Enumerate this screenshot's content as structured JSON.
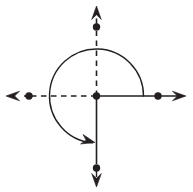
{
  "figure": {
    "title": "Coterminal rotation angle on coordinate axes",
    "canvas": {
      "width": 193,
      "height": 192,
      "background": "#ffffff"
    },
    "stroke_color": "#231f20",
    "dot_color": "#231f20",
    "arc_color": "#231f20",
    "stroke_width": 1.6,
    "arc_stroke_width": 1.4
  },
  "chart_data": {
    "type": "diagram",
    "subtype": "angle-in-standard-position",
    "title": "Coterminal rotation angle on coordinate axes",
    "origin": {
      "x": 96.5,
      "y": 96.0,
      "label": "origin"
    },
    "axes": [
      {
        "name": "positive-x-axis",
        "style": "solid",
        "from": {
          "x": 96.5,
          "y": 96.0
        },
        "to": {
          "x": 143.0,
          "y": 96.0
        },
        "continues_to": {
          "x": 181.0,
          "y": 96.0
        },
        "continuation_style": "solid",
        "arrowhead": true,
        "arrow_tip": {
          "x": 186.0,
          "y": 96.0
        },
        "direction": "right"
      },
      {
        "name": "negative-x-axis",
        "style": "dashed",
        "from": {
          "x": 96.5,
          "y": 96.0
        },
        "to": {
          "x": 24.0,
          "y": 96.0
        },
        "arrowhead": true,
        "arrow_tip": {
          "x": 6.0,
          "y": 96.0
        },
        "direction": "left"
      },
      {
        "name": "positive-y-axis",
        "style": "dashed",
        "from": {
          "x": 96.5,
          "y": 96.0
        },
        "to": {
          "x": 96.5,
          "y": 31.0
        },
        "arrowhead": true,
        "arrow_tip": {
          "x": 96.5,
          "y": 6.0
        },
        "direction": "up"
      },
      {
        "name": "negative-y-axis",
        "style": "solid",
        "from": {
          "x": 96.5,
          "y": 96.0
        },
        "to": {
          "x": 96.5,
          "y": 164.0
        },
        "arrowhead": true,
        "arrow_tip": {
          "x": 96.5,
          "y": 187.0
        },
        "direction": "down"
      }
    ],
    "points": [
      {
        "name": "origin-point",
        "x": 96.5,
        "y": 96.0,
        "radius": 3.7,
        "filled": true
      },
      {
        "name": "point-positive-x",
        "x": 158.0,
        "y": 96.0,
        "radius": 3.7,
        "filled": true
      },
      {
        "name": "point-negative-x",
        "x": 29.0,
        "y": 96.0,
        "radius": 3.7,
        "filled": true
      },
      {
        "name": "point-positive-y",
        "x": 96.5,
        "y": 27.0,
        "radius": 3.7,
        "filled": true
      },
      {
        "name": "point-negative-y",
        "x": 96.5,
        "y": 168.0,
        "radius": 3.7,
        "filled": true
      }
    ],
    "arc": {
      "name": "rotation-arc",
      "center": {
        "x": 96.5,
        "y": 96.0
      },
      "radius": 47,
      "start_angle_deg": 0,
      "end_angle_deg": -265,
      "sweep_deg": 265,
      "direction": "clockwise",
      "start_point": {
        "x": 143.5,
        "y": 96.0
      },
      "end_point": {
        "x": 92.4,
        "y": 142.8
      },
      "arrowhead_at": "end",
      "arrow_tip": {
        "x": 95.0,
        "y": 142.5
      }
    },
    "angle_measure_deg": 265,
    "legend": [],
    "labels": [],
    "grid": false
  }
}
